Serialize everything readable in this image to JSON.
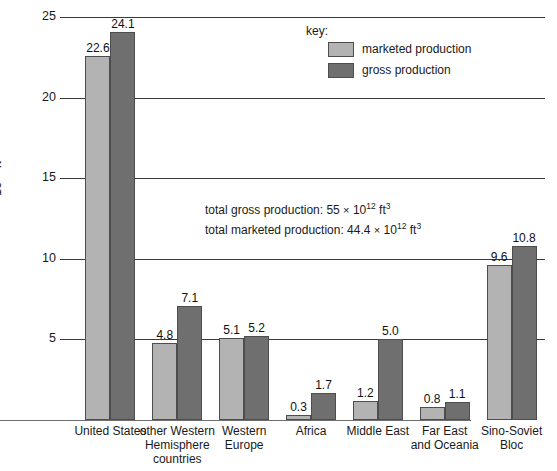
{
  "chart_data": {
    "type": "bar",
    "title": "",
    "xlabel": "",
    "ylabel": "10¹² ft³",
    "ylabel_base": "10",
    "ylabel_exp": "12",
    "ylabel_unit": " ft",
    "ylabel_unit_exp": "3",
    "ylim": [
      0,
      25
    ],
    "grid": true,
    "yticks": [
      5,
      10,
      15,
      20,
      25
    ],
    "ytick_labels": [
      "5",
      "10",
      "15",
      "20",
      "25"
    ],
    "legend_position": "top-center",
    "categories": [
      "United States",
      "other Western Hemisphere countries",
      "Western Europe",
      "Africa",
      "Middle East",
      "Far East and Oceania",
      "Sino-Soviet Bloc"
    ],
    "category_label_lines": [
      [
        "United States"
      ],
      [
        "other Western",
        "Hemisphere",
        "countries"
      ],
      [
        "Western",
        "Europe"
      ],
      [
        "Africa"
      ],
      [
        "Middle East"
      ],
      [
        "Far East",
        "and Oceania"
      ],
      [
        "Sino-Soviet",
        "Bloc"
      ]
    ],
    "series": [
      {
        "name": "marketed production",
        "color": "#b3b3b3",
        "values": [
          22.6,
          4.8,
          5.1,
          0.3,
          1.2,
          0.8,
          9.6
        ],
        "value_labels": [
          "22.6",
          "4.8",
          "5.1",
          "0.3",
          "1.2",
          "0.8",
          "9.6"
        ]
      },
      {
        "name": "gross production",
        "color": "#6f6f6f",
        "values": [
          24.1,
          7.1,
          5.2,
          1.7,
          5.0,
          1.1,
          10.8
        ],
        "value_labels": [
          "24.1",
          "7.1",
          "5.2",
          "1.7",
          "5.0",
          "1.1",
          "10.8"
        ]
      }
    ]
  },
  "legend": {
    "title": "key:",
    "entries": [
      {
        "label": "marketed production",
        "swatch": "light"
      },
      {
        "label": "gross production",
        "swatch": "dark"
      }
    ]
  },
  "annotation": {
    "line1_prefix": "total gross production: 55",
    "line1_times": "×",
    "line1_base": "10",
    "line1_exp": "12",
    "line1_unit": "ft",
    "line1_unit_exp": "3",
    "line2_prefix": "total marketed production: 44.4",
    "line2_times": "×",
    "line2_base": "10",
    "line2_exp": "12",
    "line2_unit": "ft",
    "line2_unit_exp": "3"
  },
  "colors": {
    "marketed": "#b3b3b3",
    "gross": "#6f6f6f",
    "gridline": "#3a3a3a",
    "background": "#ffffff",
    "text": "#1a1a1a"
  }
}
